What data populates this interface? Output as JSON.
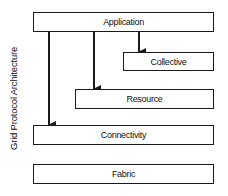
{
  "diagram": {
    "side_label": "Grid Protocol Architecture",
    "layers": [
      {
        "id": "application",
        "label": "Application"
      },
      {
        "id": "collective",
        "label": "Collective"
      },
      {
        "id": "resource",
        "label": "Resource"
      },
      {
        "id": "connectivity",
        "label": "Connectivity"
      },
      {
        "id": "fabric",
        "label": "Fabric"
      }
    ],
    "arrows": [
      {
        "from": "application",
        "to": "collective"
      },
      {
        "from": "application",
        "to": "resource"
      },
      {
        "from": "application",
        "to": "connectivity"
      }
    ],
    "colors": {
      "line": "#1a1a1a",
      "background": "#ffffff"
    }
  }
}
